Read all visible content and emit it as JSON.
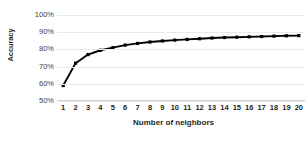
{
  "chart_data": {
    "type": "line",
    "title": "",
    "xlabel": "Number of neighbors",
    "ylabel": "Accuracy",
    "x": [
      1,
      2,
      3,
      4,
      5,
      6,
      7,
      8,
      9,
      10,
      11,
      12,
      13,
      14,
      15,
      16,
      17,
      18,
      19,
      20
    ],
    "values": [
      59,
      72,
      77,
      79.5,
      81,
      82.5,
      83.5,
      84.3,
      84.9,
      85.4,
      85.8,
      86.2,
      86.6,
      86.9,
      87.1,
      87.3,
      87.5,
      87.7,
      87.9,
      88
    ],
    "series": [
      {
        "name": "Accuracy",
        "values": [
          59,
          72,
          77,
          79.5,
          81,
          82.5,
          83.5,
          84.3,
          84.9,
          85.4,
          85.8,
          86.2,
          86.6,
          86.9,
          87.1,
          87.3,
          87.5,
          87.7,
          87.9,
          88
        ]
      }
    ],
    "xlim": [
      0.5,
      20.5
    ],
    "ylim": [
      50,
      100
    ],
    "y_ticks": [
      50,
      60,
      70,
      80,
      90,
      100
    ],
    "y_tick_labels": [
      "50%",
      "60%",
      "70%",
      "80%",
      "90%",
      "100%"
    ],
    "x_tick_labels": [
      "1",
      "2",
      "3",
      "4",
      "5",
      "6",
      "7",
      "8",
      "9",
      "10",
      "11",
      "12",
      "13",
      "14",
      "15",
      "16",
      "17",
      "18",
      "19",
      "20"
    ],
    "grid": true,
    "grid_axis": "y",
    "legend": false,
    "legend_position": "none",
    "line_color": "#000000",
    "marker": "square",
    "marker_color": "#000000",
    "gridline_color": "#e9e9e9",
    "background_color": "#ffffff"
  }
}
